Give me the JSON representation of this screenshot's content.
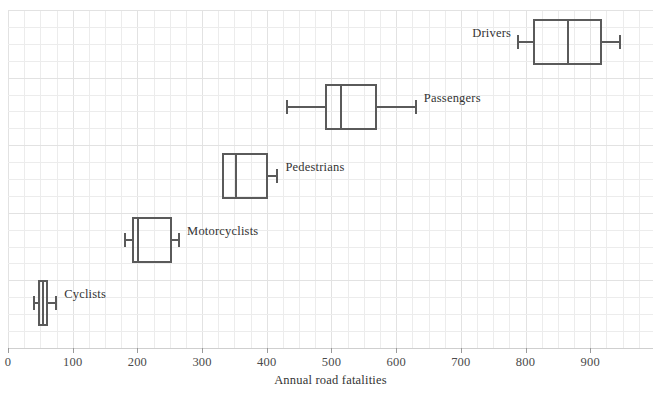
{
  "chart_data": {
    "type": "boxplot",
    "title": "",
    "xlabel": "Annual road fatalities",
    "ylabel": "",
    "xlim": [
      0,
      997
    ],
    "xticks": [
      0,
      100,
      200,
      300,
      400,
      500,
      600,
      700,
      800,
      900
    ],
    "xtick_labels": [
      "0",
      "100",
      "200",
      "300",
      "400",
      "500",
      "600",
      "700",
      "800",
      "900"
    ],
    "grid": true,
    "legend": "none",
    "orientation": "horizontal",
    "categories": [
      "Drivers",
      "Passengers",
      "Pedestrians",
      "Motorcyclists",
      "Cyclists"
    ],
    "boxes": [
      {
        "label": "Drivers",
        "min": 787,
        "q1": 811,
        "median": 866,
        "q3": 918,
        "max": 948,
        "label_side": "left"
      },
      {
        "label": "Passengers",
        "min": 430,
        "q1": 490,
        "median": 514,
        "q3": 570,
        "max": 632,
        "label_side": "right"
      },
      {
        "label": "Pedestrians",
        "min": 331,
        "q1": 331,
        "median": 353,
        "q3": 402,
        "max": 418,
        "label_side": "right"
      },
      {
        "label": "Motorcyclists",
        "min": 179,
        "q1": 192,
        "median": 201,
        "q3": 254,
        "max": 266,
        "label_side": "right"
      },
      {
        "label": "Cyclists",
        "min": 39,
        "q1": 46,
        "median": 54,
        "q3": 62,
        "max": 76,
        "label_side": "right"
      }
    ],
    "colors": {
      "box_stroke": "#5a5a5a",
      "grid": "#ececec",
      "axis": "#cfcfcf",
      "text": "#333333",
      "background": "#ffffff"
    }
  }
}
